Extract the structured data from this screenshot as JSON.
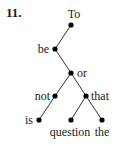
{
  "problem_number": "11.",
  "tree": {
    "nodes": [
      {
        "id": "To",
        "label": "To",
        "x": 71,
        "y": 25,
        "lx": 74,
        "ly": 18,
        "anchor": "middle"
      },
      {
        "id": "be",
        "label": "be",
        "x": 55,
        "y": 49,
        "lx": 49,
        "ly": 53,
        "anchor": "end"
      },
      {
        "id": "or",
        "label": "or",
        "x": 71,
        "y": 73,
        "lx": 77,
        "ly": 77,
        "anchor": "start"
      },
      {
        "id": "not",
        "label": "not",
        "x": 55,
        "y": 96,
        "lx": 50,
        "ly": 100,
        "anchor": "end"
      },
      {
        "id": "that",
        "label": "that",
        "x": 86,
        "y": 96,
        "lx": 91,
        "ly": 100,
        "anchor": "start"
      },
      {
        "id": "is",
        "label": "is",
        "x": 39,
        "y": 120,
        "lx": 33,
        "ly": 124,
        "anchor": "end"
      },
      {
        "id": "question",
        "label": "question",
        "x": 71,
        "y": 120,
        "lx": 70,
        "ly": 136,
        "anchor": "middle"
      },
      {
        "id": "the",
        "label": "the",
        "x": 102,
        "y": 120,
        "lx": 102,
        "ly": 136,
        "anchor": "middle"
      }
    ],
    "edges": [
      [
        "To",
        "be"
      ],
      [
        "be",
        "or"
      ],
      [
        "or",
        "not"
      ],
      [
        "or",
        "that"
      ],
      [
        "not",
        "is"
      ],
      [
        "that",
        "question"
      ],
      [
        "that",
        "the"
      ]
    ]
  }
}
